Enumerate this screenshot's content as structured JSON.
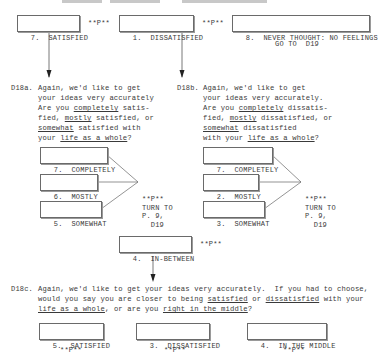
{
  "top_row": {
    "options": [
      {
        "code": "7.",
        "label": "SATISFIED",
        "skip": "**P**"
      },
      {
        "code": "1.",
        "label": "DISSATISFIED",
        "skip": "**P**"
      },
      {
        "code": "8.",
        "label": "NEVER THOUGHT: NO FEELINGS",
        "skip": "GO TO  D19"
      }
    ]
  },
  "d18a": {
    "id": "D18a.",
    "line1": "Again, we'd like to get",
    "line2": "your ideas very accurately",
    "line3_pre": "Are you ",
    "line3_u": "completely",
    "line3_post": " satis-",
    "line4_pre": "fied, ",
    "line4_u": "mostly",
    "line4_post": " satisfied, or",
    "line5_u": "somewhat",
    "line5_post": " satisfied with",
    "line6_pre": "your ",
    "line6_u": "life as a whole",
    "line6_post": "?",
    "options": [
      {
        "code": "7.",
        "label": "COMPLETELY"
      },
      {
        "code": "6.",
        "label": "MOSTLY"
      },
      {
        "code": "5.",
        "label": "SOMEWHAT"
      }
    ],
    "skip": [
      "**P**",
      "TURN TO",
      "P. 9,",
      "  D19"
    ]
  },
  "d18b": {
    "id": "D18b.",
    "line1": "Again, we'd like to get",
    "line2": "your ideas very accurately.",
    "line3_pre": "Are you ",
    "line3_u": "completely",
    "line3_post": " dissatis-",
    "line4_pre": "fied, ",
    "line4_u": "mostly",
    "line4_post": " dissatisfied, or",
    "line5_u": "somewhat",
    "line5_post": " dissatisfied",
    "line6_pre": "with your ",
    "line6_u": "life as a whole",
    "line6_post": "?",
    "options": [
      {
        "code": "7.",
        "label": "COMPLETELY"
      },
      {
        "code": "2.",
        "label": "MOSTLY"
      },
      {
        "code": "3.",
        "label": "SOMEWHAT"
      }
    ],
    "skip": [
      "**P**",
      "TURN TO",
      "P. 9,",
      "  D19"
    ]
  },
  "in_between": {
    "code": "4.",
    "label": "IN-BETWEEN",
    "skip": "**P**"
  },
  "d18c": {
    "id": "D18c.",
    "l1": "Again, we'd like to get your ideas very accurately.  If you had to choose,",
    "l2_pre": "would you say you are closer to being ",
    "l2_u1": "satisfied",
    "l2_mid": " or ",
    "l2_u2": "dissatisfied",
    "l2_post": " with your",
    "l3_u1": "life as a whole",
    "l3_mid": ", or are you ",
    "l3_u2": "right in the middle",
    "l3_post": "?",
    "options": [
      {
        "code": "5.",
        "label": "SATISFIED",
        "skip": "**P**"
      },
      {
        "code": "3.",
        "label": "DISSATISFIED",
        "skip": "**P**"
      },
      {
        "code": "4.",
        "label": "IN THE MIDDLE",
        "skip": "**P**"
      }
    ]
  }
}
